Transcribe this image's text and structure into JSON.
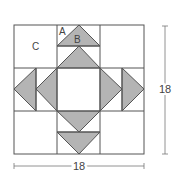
{
  "diagram": {
    "type": "quilt-block",
    "labels": {
      "piece_a": "A",
      "piece_b": "B",
      "piece_c": "C"
    },
    "dimensions": {
      "width_label": "18",
      "height_label": "18"
    },
    "colors": {
      "fill": "#b4b4b4",
      "line": "#555555",
      "background": "#ffffff"
    }
  }
}
